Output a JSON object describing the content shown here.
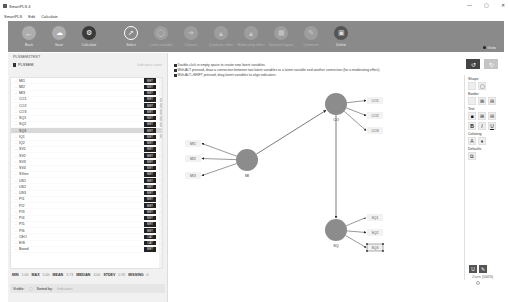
{
  "window": {
    "title": "SmartPLS 4",
    "controls": [
      "—",
      "▢",
      "✕"
    ]
  },
  "menu": [
    "SmartPLS",
    "Edit",
    "Calculate"
  ],
  "toolbar": {
    "tools": [
      {
        "id": "back",
        "label": "Back",
        "icon": "←",
        "style": "light"
      },
      {
        "id": "save",
        "label": "Save",
        "icon": "☁",
        "style": "light"
      },
      {
        "id": "calculate",
        "label": "Calculate",
        "icon": "⚙",
        "style": "dark"
      },
      {
        "id": "select",
        "label": "Select",
        "icon": "➚",
        "style": "outline"
      },
      {
        "id": "latent-variable",
        "label": "Latent variable",
        "icon": "◯",
        "style": "dim"
      },
      {
        "id": "connect",
        "label": "Connect",
        "icon": "➜",
        "style": "dim"
      },
      {
        "id": "quadratic-effect",
        "label": "Quadratic effect",
        "icon": "▲",
        "style": "dim"
      },
      {
        "id": "moderating-effect",
        "label": "Moderating effect",
        "icon": "▲",
        "style": "dim"
      },
      {
        "id": "generate-layout",
        "label": "Generate layout",
        "icon": "▦",
        "style": "dim"
      },
      {
        "id": "comment",
        "label": "Comment",
        "icon": "✎",
        "style": "dim"
      },
      {
        "id": "delete",
        "label": "Delete",
        "icon": "▣",
        "style": "delete"
      }
    ],
    "goto_label": "Goto"
  },
  "left_panel": {
    "header": "PLSSEM1TEST",
    "project": "PLSSEM",
    "project_right": "Indicators count",
    "indicators": [
      {
        "name": "MI1",
        "badge": "MET"
      },
      {
        "name": "MI2",
        "badge": "MET"
      },
      {
        "name": "MI3",
        "badge": "MET"
      },
      {
        "name": "CO1",
        "badge": "MET"
      },
      {
        "name": "CO2",
        "badge": "MET"
      },
      {
        "name": "CO3",
        "badge": "MET"
      },
      {
        "name": "SQ1",
        "badge": "MET"
      },
      {
        "name": "SQ2",
        "badge": "MET"
      },
      {
        "name": "SQ3",
        "badge": "MET",
        "selected": true
      },
      {
        "name": "IQ1",
        "badge": "MET"
      },
      {
        "name": "IQ2",
        "badge": "MET"
      },
      {
        "name": "SV1",
        "badge": "MET"
      },
      {
        "name": "SV2",
        "badge": "MET"
      },
      {
        "name": "SV3",
        "badge": "MET"
      },
      {
        "name": "SV4",
        "badge": "MET"
      },
      {
        "name": "SVsin",
        "badge": "MET"
      },
      {
        "name": "US1",
        "badge": "MET"
      },
      {
        "name": "US2",
        "badge": "MET"
      },
      {
        "name": "US3",
        "badge": "MET"
      },
      {
        "name": "PI1",
        "badge": "MET"
      },
      {
        "name": "PI2",
        "badge": "MET"
      },
      {
        "name": "PI3",
        "badge": "MET"
      },
      {
        "name": "PI4",
        "badge": "MET"
      },
      {
        "name": "PI5",
        "badge": "MET"
      },
      {
        "name": "PI6",
        "badge": "MET"
      },
      {
        "name": "CEO",
        "badge": "CAT"
      },
      {
        "name": "EIS",
        "badge": "CAT"
      },
      {
        "name": "Brand",
        "badge": "MET"
      }
    ],
    "stats": {
      "min_label": "MIN",
      "min": "1.00",
      "max_label": "MAX",
      "max": "5.00",
      "mean_label": "MEAN",
      "mean": "3.73",
      "median_label": "MEDIAN",
      "median": "4.00",
      "stdev_label": "STDEV",
      "stdev": "0.95",
      "missing_label": "MISSING",
      "missing": "0"
    },
    "visible_label": "Visible:",
    "sorted_label": "Sorted by:",
    "sorted_value": "Indicators"
  },
  "canvas": {
    "hints": [
      "Double-click in empty space to create new latent variables.",
      "With ALT pressed, draw a connection between two latent variables or a latent variable and another connection (for a moderating effect).",
      "With ALT+SHIFT pressed, drag latent variables to align indicators."
    ],
    "constructs": [
      {
        "id": "MI",
        "label": "MI",
        "cx": 77,
        "cy": 107
      },
      {
        "id": "CO",
        "label": "CO",
        "cx": 166,
        "cy": 51
      },
      {
        "id": "SQ",
        "label": "SQ",
        "cx": 166,
        "cy": 177
      }
    ],
    "indicators": [
      {
        "label": "MI1",
        "x": 15,
        "y": 87,
        "of": "MI"
      },
      {
        "label": "MI2",
        "x": 15,
        "y": 102,
        "of": "MI"
      },
      {
        "label": "MI3",
        "x": 15,
        "y": 119,
        "of": "MI"
      },
      {
        "label": "CO1",
        "x": 197,
        "y": 44,
        "of": "CO"
      },
      {
        "label": "CO2",
        "x": 197,
        "y": 59,
        "of": "CO"
      },
      {
        "label": "CO3",
        "x": 197,
        "y": 74,
        "of": "CO"
      },
      {
        "label": "SQ1",
        "x": 197,
        "y": 161,
        "of": "SQ"
      },
      {
        "label": "SQ2",
        "x": 197,
        "y": 176,
        "of": "SQ"
      },
      {
        "label": "SQ3",
        "x": 197,
        "y": 191,
        "of": "SQ",
        "selected": true
      }
    ],
    "paths": [
      {
        "from": "MI",
        "to": "CO"
      },
      {
        "from": "CO",
        "to": "SQ"
      }
    ],
    "colors": {
      "construct_fill": "#8c8c8c",
      "indicator_fill": "#f2f2f2",
      "arrow": "#222222"
    }
  },
  "right_panel": {
    "undo_icon": "↺",
    "redo_icon": "↻",
    "sections": {
      "shape": "Shape",
      "border": "Border",
      "text": "Text",
      "coloring": "Coloring",
      "defaults": "Defaults"
    },
    "text_style_buttons": [
      "B",
      "I",
      "U"
    ],
    "zoom_label": "Zoom",
    "zoom_value": "(100%)"
  }
}
